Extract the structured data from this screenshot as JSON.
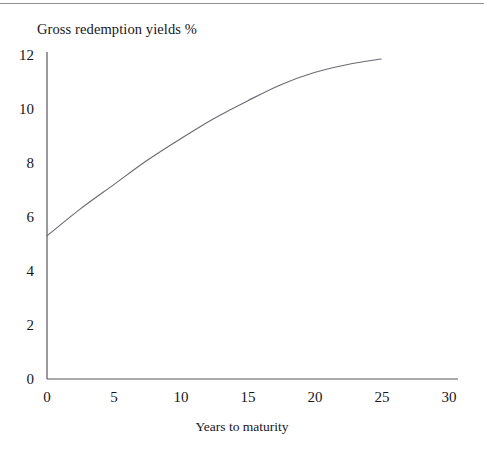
{
  "chart_data": {
    "type": "line",
    "title": "Gross redemption yields %",
    "xlabel": "Years to maturity",
    "ylabel": "",
    "xlim": [
      0,
      30
    ],
    "ylim": [
      0,
      12
    ],
    "grid": false,
    "legend": null,
    "xticks": [
      "0",
      "5",
      "10",
      "15",
      "20",
      "25",
      "30"
    ],
    "xtick_values": [
      0,
      5,
      10,
      15,
      20,
      25,
      30
    ],
    "yticks": [
      "0",
      "2",
      "4",
      "6",
      "8",
      "10",
      "12"
    ],
    "ytick_values": [
      0,
      2,
      4,
      6,
      8,
      10,
      12
    ],
    "series": [
      {
        "name": "Gross redemption yield curve",
        "x": [
          0,
          2.5,
          5,
          7.5,
          10,
          12.5,
          15,
          17.5,
          20,
          22.5,
          25
        ],
        "values": [
          5.3,
          6.3,
          7.2,
          8.1,
          8.9,
          9.65,
          10.3,
          10.9,
          11.35,
          11.65,
          11.85
        ]
      }
    ],
    "line_color": "#6b6b75",
    "axis_color": "#55555e"
  },
  "axis": {
    "y_title": "Gross redemption yields %",
    "x_title": "Years to maturity"
  }
}
